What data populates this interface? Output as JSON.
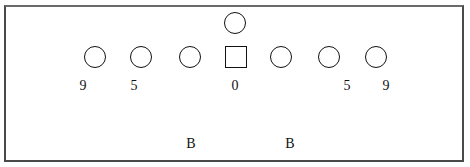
{
  "diagram": {
    "type": "football-formation",
    "players": [
      {
        "id": "qb",
        "shape": "circle",
        "x": 235,
        "y": 23
      },
      {
        "id": "lt-end",
        "shape": "circle",
        "x": 95,
        "y": 57
      },
      {
        "id": "l-tackle",
        "shape": "circle",
        "x": 141,
        "y": 57
      },
      {
        "id": "l-guard",
        "shape": "circle",
        "x": 190,
        "y": 57
      },
      {
        "id": "center",
        "shape": "square",
        "x": 236,
        "y": 57
      },
      {
        "id": "r-guard",
        "shape": "circle",
        "x": 281,
        "y": 57
      },
      {
        "id": "r-tackle",
        "shape": "circle",
        "x": 329,
        "y": 57
      },
      {
        "id": "rt-end",
        "shape": "circle",
        "x": 376,
        "y": 57
      }
    ],
    "technique_labels": [
      {
        "text": "9",
        "x": 83,
        "y": 86
      },
      {
        "text": "5",
        "x": 134,
        "y": 86
      },
      {
        "text": "0",
        "x": 235,
        "y": 86
      },
      {
        "text": "5",
        "x": 347,
        "y": 86
      },
      {
        "text": "9",
        "x": 386,
        "y": 86
      }
    ],
    "backer_labels": [
      {
        "text": "B",
        "x": 191,
        "y": 144
      },
      {
        "text": "B",
        "x": 290,
        "y": 144
      }
    ]
  }
}
